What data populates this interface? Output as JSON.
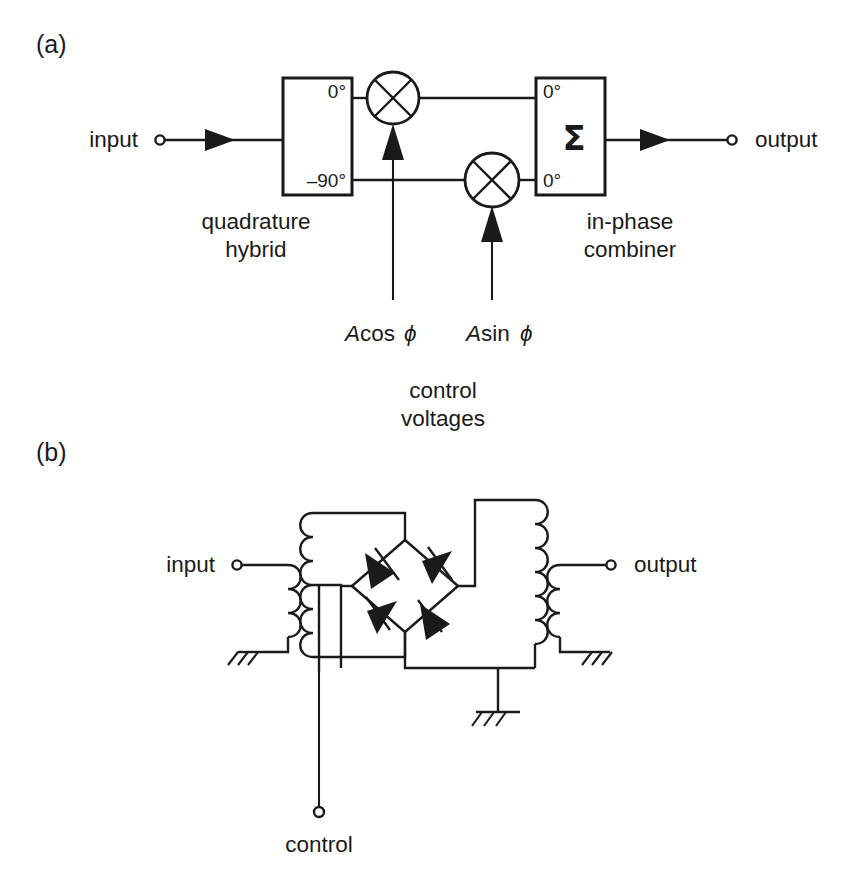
{
  "figure": {
    "panels": [
      {
        "id": "a",
        "label": "(a)",
        "caption": "quadrature-hybrid vector modulator"
      },
      {
        "id": "b",
        "label": "(b)",
        "caption": "diode bridge reflection modulator"
      }
    ],
    "line_color": "#1a1a1a",
    "background_color": "#ffffff"
  },
  "panel_a": {
    "label": "(a)",
    "input_port_label": "input",
    "output_port_label": "output",
    "hybrid": {
      "name": "quadrature hybrid",
      "caption_line1": "quadrature",
      "caption_line2": "hybrid",
      "port_top_label": "0°",
      "port_bottom_label": "–90°"
    },
    "combiner": {
      "name": "in-phase combiner",
      "caption_line1": "in-phase",
      "caption_line2": "combiner",
      "port_top_label": "0°",
      "port_bottom_label": "0°",
      "symbol": "Σ"
    },
    "mixers": [
      {
        "id": "mixer-upper",
        "symbol": "X",
        "control_label_A": "A",
        "control_label_fn": "cos",
        "control_label_phi": "ϕ"
      },
      {
        "id": "mixer-lower",
        "symbol": "X",
        "control_label_A": "A",
        "control_label_fn": "sin",
        "control_label_phi": "ϕ"
      }
    ],
    "control_upper": {
      "A": "A",
      "fn": "cos",
      "phi": "ϕ"
    },
    "control_lower": {
      "A": "A",
      "fn": "sin",
      "phi": "ϕ"
    },
    "control_caption_line1": "control",
    "control_caption_line2": "voltages"
  },
  "panel_b": {
    "label": "(b)",
    "input_port_label": "input",
    "output_port_label": "output",
    "control_port_label": "control",
    "components": {
      "input_transformer": "input balun transformer",
      "output_transformer": "output balun transformer",
      "diode_bridge": "four-diode bridge",
      "diode_count": 4,
      "ground_symbols": 3
    }
  }
}
